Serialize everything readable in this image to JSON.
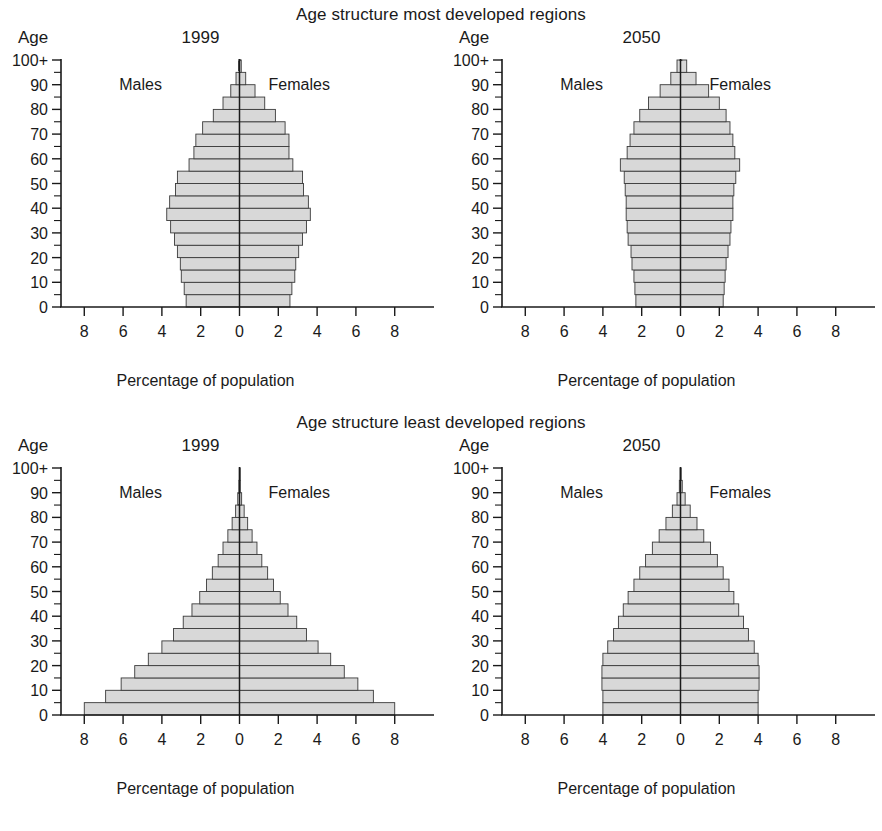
{
  "figures": [
    {
      "id": "most-developed",
      "title": "Age structure most developed regions",
      "panels": [
        {
          "id": "most-1999",
          "age_label": "Age",
          "year": "1999",
          "males_label": "Males",
          "females_label": "Females",
          "xaxis_title": "Percentage of population"
        },
        {
          "id": "most-2050",
          "age_label": "Age",
          "year": "2050",
          "males_label": "Males",
          "females_label": "Females",
          "xaxis_title": "Percentage of population"
        }
      ]
    },
    {
      "id": "least-developed",
      "title": "Age structure least developed regions",
      "panels": [
        {
          "id": "least-1999",
          "age_label": "Age",
          "year": "1999",
          "males_label": "Males",
          "females_label": "Females",
          "xaxis_title": "Percentage of population"
        },
        {
          "id": "least-2050",
          "age_label": "Age",
          "year": "2050",
          "males_label": "Males",
          "females_label": "Females",
          "xaxis_title": "Percentage of population"
        }
      ]
    }
  ],
  "axes": {
    "x_ticks": [
      "8",
      "6",
      "4",
      "2",
      "0",
      "2",
      "4",
      "6",
      "8"
    ],
    "x_tick_values": [
      -8,
      -6,
      -4,
      -2,
      0,
      2,
      4,
      6,
      8
    ],
    "x_min": -9.2,
    "x_max": 9.2,
    "y_ticks": [
      "100+",
      "90",
      "80",
      "70",
      "60",
      "50",
      "40",
      "30",
      "20",
      "10",
      "0"
    ],
    "y_tick_values": [
      100,
      90,
      80,
      70,
      60,
      50,
      40,
      30,
      20,
      10,
      0
    ],
    "y_minor_step": 5,
    "y_min": 0,
    "y_max": 100,
    "bar_fill": "#d8d8d8",
    "bar_stroke": "#3a3a3a",
    "axis_color": "#1a1a1a"
  },
  "chart_data": [
    {
      "type": "bar",
      "id": "most-1999",
      "title": "Age structure most developed regions",
      "subtitle": "1999",
      "orientation": "population-pyramid",
      "xlabel": "Percentage of population",
      "ylabel": "Age",
      "xlim": [
        -9.2,
        9.2
      ],
      "ylim": [
        0,
        100
      ],
      "grid": false,
      "legend": [
        "Males",
        "Females"
      ],
      "legend_position": "inside-top",
      "categories": [
        "0-4",
        "5-9",
        "10-14",
        "15-19",
        "20-24",
        "25-29",
        "30-34",
        "35-39",
        "40-44",
        "45-49",
        "50-54",
        "55-59",
        "60-64",
        "65-69",
        "70-74",
        "75-79",
        "80-84",
        "85-89",
        "90-94",
        "95-99",
        "100+"
      ],
      "series": [
        {
          "name": "Males",
          "values": [
            2.75,
            2.85,
            3.0,
            3.05,
            3.2,
            3.35,
            3.55,
            3.75,
            3.6,
            3.3,
            3.2,
            2.6,
            2.35,
            2.25,
            1.9,
            1.35,
            0.85,
            0.45,
            0.18,
            0.05,
            0.01
          ]
        },
        {
          "name": "Females",
          "values": [
            2.6,
            2.7,
            2.85,
            2.9,
            3.05,
            3.25,
            3.45,
            3.65,
            3.55,
            3.3,
            3.25,
            2.75,
            2.55,
            2.55,
            2.35,
            1.85,
            1.3,
            0.8,
            0.32,
            0.09,
            0.02
          ]
        }
      ]
    },
    {
      "type": "bar",
      "id": "most-2050",
      "title": "Age structure most developed regions",
      "subtitle": "2050",
      "orientation": "population-pyramid",
      "xlabel": "Percentage of population",
      "ylabel": "Age",
      "xlim": [
        -9.2,
        9.2
      ],
      "ylim": [
        0,
        100
      ],
      "grid": false,
      "legend": [
        "Males",
        "Females"
      ],
      "legend_position": "inside-top",
      "categories": [
        "0-4",
        "5-9",
        "10-14",
        "15-19",
        "20-24",
        "25-29",
        "30-34",
        "35-39",
        "40-44",
        "45-49",
        "50-54",
        "55-59",
        "60-64",
        "65-69",
        "70-74",
        "75-79",
        "80-84",
        "85-89",
        "90-94",
        "95-99",
        "100+"
      ],
      "series": [
        {
          "name": "Males",
          "values": [
            2.3,
            2.35,
            2.4,
            2.5,
            2.55,
            2.7,
            2.75,
            2.8,
            2.8,
            2.85,
            2.9,
            3.1,
            2.75,
            2.6,
            2.4,
            2.1,
            1.65,
            1.05,
            0.5,
            0.18,
            0.03
          ]
        },
        {
          "name": "Females",
          "values": [
            2.2,
            2.25,
            2.3,
            2.35,
            2.45,
            2.55,
            2.6,
            2.7,
            2.7,
            2.75,
            2.85,
            3.05,
            2.8,
            2.7,
            2.55,
            2.35,
            2.0,
            1.45,
            0.8,
            0.32,
            0.07
          ]
        }
      ]
    },
    {
      "type": "bar",
      "id": "least-1999",
      "title": "Age structure least developed regions",
      "subtitle": "1999",
      "orientation": "population-pyramid",
      "xlabel": "Percentage of population",
      "ylabel": "Age",
      "xlim": [
        -9.2,
        9.2
      ],
      "ylim": [
        0,
        100
      ],
      "grid": false,
      "legend": [
        "Males",
        "Females"
      ],
      "legend_position": "inside-top",
      "categories": [
        "0-4",
        "5-9",
        "10-14",
        "15-19",
        "20-24",
        "25-29",
        "30-34",
        "35-39",
        "40-44",
        "45-49",
        "50-54",
        "55-59",
        "60-64",
        "65-69",
        "70-74",
        "75-79",
        "80-84",
        "85-89",
        "90-94",
        "95-99",
        "100+"
      ],
      "series": [
        {
          "name": "Males",
          "values": [
            8.0,
            6.9,
            6.1,
            5.4,
            4.7,
            4.0,
            3.4,
            2.9,
            2.45,
            2.05,
            1.7,
            1.4,
            1.1,
            0.85,
            0.6,
            0.38,
            0.2,
            0.09,
            0.03,
            0.01,
            0.0
          ]
        },
        {
          "name": "Females",
          "values": [
            8.0,
            6.9,
            6.1,
            5.4,
            4.7,
            4.05,
            3.45,
            2.95,
            2.5,
            2.1,
            1.75,
            1.45,
            1.15,
            0.9,
            0.65,
            0.42,
            0.24,
            0.11,
            0.04,
            0.01,
            0.0
          ]
        }
      ]
    },
    {
      "type": "bar",
      "id": "least-2050",
      "title": "Age structure least developed regions",
      "subtitle": "2050",
      "orientation": "population-pyramid",
      "xlabel": "Percentage of population",
      "ylabel": "Age",
      "xlim": [
        -9.2,
        9.2
      ],
      "ylim": [
        0,
        100
      ],
      "grid": false,
      "legend": [
        "Males",
        "Females"
      ],
      "legend_position": "inside-top",
      "categories": [
        "0-4",
        "5-9",
        "10-14",
        "15-19",
        "20-24",
        "25-29",
        "30-34",
        "35-39",
        "40-44",
        "45-49",
        "50-54",
        "55-59",
        "60-64",
        "65-69",
        "70-74",
        "75-79",
        "80-84",
        "85-89",
        "90-94",
        "95-99",
        "100+"
      ],
      "series": [
        {
          "name": "Males",
          "values": [
            4.0,
            4.0,
            4.05,
            4.05,
            4.0,
            3.75,
            3.45,
            3.2,
            2.95,
            2.7,
            2.4,
            2.1,
            1.8,
            1.45,
            1.1,
            0.75,
            0.42,
            0.18,
            0.06,
            0.02,
            0.0
          ]
        },
        {
          "name": "Females",
          "values": [
            4.0,
            4.0,
            4.05,
            4.05,
            4.0,
            3.8,
            3.5,
            3.25,
            3.0,
            2.75,
            2.5,
            2.2,
            1.9,
            1.55,
            1.2,
            0.85,
            0.5,
            0.24,
            0.09,
            0.03,
            0.0
          ]
        }
      ]
    }
  ]
}
